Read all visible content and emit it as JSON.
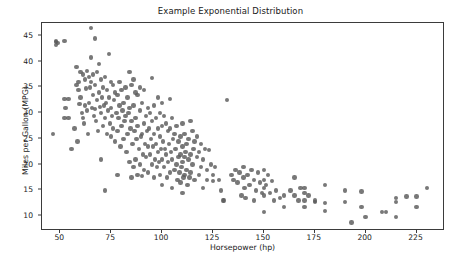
{
  "chart_data": {
    "type": "scatter",
    "title": "Example Exponential Distribution",
    "xlabel": "Horsepower (hp)",
    "ylabel": "Miles per Gallon (MPG)",
    "xlim": [
      41,
      238
    ],
    "ylim": [
      7.5,
      47.5
    ],
    "xticks": [
      50,
      75,
      100,
      125,
      150,
      175,
      200,
      225
    ],
    "xtick_labels": [
      "50",
      "75",
      "100",
      "125",
      "150",
      "175",
      "200",
      "225"
    ],
    "yticks": [
      10,
      15,
      20,
      25,
      30,
      35,
      40,
      45
    ],
    "ytick_labels": [
      "10",
      "15",
      "20",
      "25",
      "30",
      "35",
      "40",
      "45"
    ],
    "grid": false,
    "legend": null,
    "marker": {
      "shape": "circle",
      "color": "#5a5a5a",
      "opacity": 0.82,
      "size_px": 4.4
    },
    "series": [
      {
        "name": "vehicles",
        "points": [
          [
            46.5,
            26.0
          ],
          [
            48.0,
            43.8
          ],
          [
            48.0,
            43.2
          ],
          [
            48.0,
            44.0
          ],
          [
            49.0,
            43.6
          ],
          [
            52.0,
            44.0
          ],
          [
            52.0,
            32.8
          ],
          [
            52.0,
            29.0
          ],
          [
            52.5,
            31.0
          ],
          [
            54.0,
            29.0
          ],
          [
            54.0,
            32.8
          ],
          [
            55.5,
            23.0
          ],
          [
            57.0,
            27.0
          ],
          [
            58.0,
            39.0
          ],
          [
            58.0,
            35.5
          ],
          [
            58.5,
            24.5
          ],
          [
            59.0,
            36.0
          ],
          [
            59.0,
            34.5
          ],
          [
            59.5,
            31.8
          ],
          [
            60.0,
            38.0
          ],
          [
            60.0,
            33.0
          ],
          [
            60.5,
            30.0
          ],
          [
            61.0,
            37.5
          ],
          [
            61.0,
            29.0
          ],
          [
            61.5,
            28.0
          ],
          [
            62.0,
            36.5
          ],
          [
            62.0,
            31.5
          ],
          [
            62.5,
            34.8
          ],
          [
            63.0,
            38.2
          ],
          [
            63.0,
            30.5
          ],
          [
            63.5,
            26.0
          ],
          [
            64.0,
            37.0
          ],
          [
            64.0,
            32.0
          ],
          [
            64.5,
            35.0
          ],
          [
            65.0,
            46.5
          ],
          [
            65.0,
            40.8
          ],
          [
            65.0,
            36.0
          ],
          [
            65.5,
            31.0
          ],
          [
            66.0,
            37.5
          ],
          [
            66.0,
            33.5
          ],
          [
            66.5,
            29.5
          ],
          [
            67.0,
            44.5
          ],
          [
            67.0,
            35.5
          ],
          [
            67.0,
            30.8
          ],
          [
            67.5,
            28.5
          ],
          [
            68.0,
            38.0
          ],
          [
            68.0,
            32.5
          ],
          [
            68.5,
            26.5
          ],
          [
            69.0,
            39.5
          ],
          [
            69.0,
            34.0
          ],
          [
            69.5,
            31.2
          ],
          [
            70.0,
            36.5
          ],
          [
            70.0,
            30.0
          ],
          [
            70.0,
            21.0
          ],
          [
            70.5,
            33.0
          ],
          [
            71.0,
            35.0
          ],
          [
            71.0,
            27.5
          ],
          [
            71.5,
            31.5
          ],
          [
            72.0,
            37.0
          ],
          [
            72.0,
            29.0
          ],
          [
            72.0,
            15.0
          ],
          [
            72.5,
            32.0
          ],
          [
            73.0,
            34.5
          ],
          [
            73.0,
            26.0
          ],
          [
            73.5,
            30.5
          ],
          [
            74.0,
            41.5
          ],
          [
            74.0,
            33.0
          ],
          [
            74.5,
            28.0
          ],
          [
            75.0,
            36.0
          ],
          [
            75.0,
            31.0
          ],
          [
            75.0,
            25.5
          ],
          [
            75.5,
            29.5
          ],
          [
            76.0,
            35.5
          ],
          [
            76.0,
            27.0
          ],
          [
            76.5,
            32.5
          ],
          [
            77.0,
            34.0
          ],
          [
            77.0,
            24.5
          ],
          [
            77.5,
            30.0
          ],
          [
            78.0,
            33.5
          ],
          [
            78.0,
            26.5
          ],
          [
            78.0,
            18.0
          ],
          [
            78.5,
            29.0
          ],
          [
            79.0,
            36.0
          ],
          [
            79.0,
            31.5
          ],
          [
            79.5,
            23.5
          ],
          [
            80.0,
            34.5
          ],
          [
            80.0,
            27.5
          ],
          [
            80.5,
            30.5
          ],
          [
            81.0,
            32.0
          ],
          [
            81.0,
            25.0
          ],
          [
            81.5,
            28.5
          ],
          [
            82.0,
            35.0
          ],
          [
            82.0,
            29.5
          ],
          [
            82.5,
            22.5
          ],
          [
            83.0,
            33.0
          ],
          [
            83.0,
            26.0
          ],
          [
            83.5,
            30.0
          ],
          [
            84.0,
            38.0
          ],
          [
            84.0,
            31.0
          ],
          [
            84.0,
            20.5
          ],
          [
            84.5,
            27.0
          ],
          [
            85.0,
            35.5
          ],
          [
            85.0,
            28.5
          ],
          [
            85.0,
            17.5
          ],
          [
            85.5,
            24.0
          ],
          [
            86.0,
            36.5
          ],
          [
            86.0,
            31.5
          ],
          [
            86.0,
            19.5
          ],
          [
            86.5,
            26.5
          ],
          [
            87.0,
            34.0
          ],
          [
            87.0,
            29.0
          ],
          [
            87.0,
            21.0
          ],
          [
            87.5,
            25.0
          ],
          [
            88.0,
            33.5
          ],
          [
            88.0,
            27.5
          ],
          [
            88.0,
            18.0
          ],
          [
            88.5,
            23.0
          ],
          [
            89.0,
            35.0
          ],
          [
            89.0,
            30.5
          ],
          [
            89.0,
            20.0
          ],
          [
            89.5,
            25.5
          ],
          [
            90.0,
            32.0
          ],
          [
            90.0,
            26.0
          ],
          [
            90.0,
            17.8
          ],
          [
            90.5,
            22.0
          ],
          [
            91.0,
            34.5
          ],
          [
            91.0,
            28.0
          ],
          [
            91.0,
            19.0
          ],
          [
            91.5,
            24.0
          ],
          [
            92.0,
            29.5
          ],
          [
            92.0,
            21.5
          ],
          [
            92.5,
            26.5
          ],
          [
            93.0,
            31.0
          ],
          [
            93.0,
            23.5
          ],
          [
            93.0,
            18.5
          ],
          [
            93.5,
            27.0
          ],
          [
            94.0,
            30.0
          ],
          [
            94.0,
            22.0
          ],
          [
            94.5,
            25.0
          ],
          [
            95.0,
            36.8
          ],
          [
            95.0,
            28.5
          ],
          [
            95.0,
            20.0
          ],
          [
            95.5,
            23.5
          ],
          [
            96.0,
            31.5
          ],
          [
            96.0,
            26.0
          ],
          [
            96.0,
            17.5
          ],
          [
            96.5,
            21.0
          ],
          [
            97.0,
            29.0
          ],
          [
            97.0,
            24.0
          ],
          [
            97.5,
            19.5
          ],
          [
            98.0,
            33.0
          ],
          [
            98.0,
            27.0
          ],
          [
            98.0,
            22.5
          ],
          [
            98.5,
            20.5
          ],
          [
            99.0,
            30.0
          ],
          [
            99.0,
            25.5
          ],
          [
            99.0,
            18.0
          ],
          [
            99.5,
            23.0
          ],
          [
            100.0,
            32.0
          ],
          [
            100.0,
            27.5
          ],
          [
            100.0,
            21.0
          ],
          [
            100.0,
            16.0
          ],
          [
            100.5,
            24.5
          ],
          [
            101.0,
            29.5
          ],
          [
            101.0,
            19.5
          ],
          [
            101.5,
            23.0
          ],
          [
            102.0,
            28.0
          ],
          [
            102.0,
            22.0
          ],
          [
            102.5,
            17.5
          ],
          [
            103.0,
            26.5
          ],
          [
            103.0,
            20.5
          ],
          [
            103.5,
            24.0
          ],
          [
            104.0,
            32.8
          ],
          [
            104.0,
            27.0
          ],
          [
            104.0,
            18.5
          ],
          [
            104.5,
            22.5
          ],
          [
            105.0,
            29.0
          ],
          [
            105.0,
            21.0
          ],
          [
            105.0,
            15.5
          ],
          [
            105.5,
            25.0
          ],
          [
            106.0,
            26.0
          ],
          [
            106.0,
            19.0
          ],
          [
            106.5,
            23.0
          ],
          [
            107.0,
            27.5
          ],
          [
            107.0,
            20.0
          ],
          [
            107.5,
            17.0
          ],
          [
            108.0,
            24.5
          ],
          [
            108.0,
            21.5
          ],
          [
            108.5,
            18.5
          ],
          [
            109.0,
            25.5
          ],
          [
            109.0,
            22.0
          ],
          [
            109.0,
            16.5
          ],
          [
            109.5,
            19.5
          ],
          [
            110.0,
            28.0
          ],
          [
            110.0,
            23.5
          ],
          [
            110.0,
            20.5
          ],
          [
            110.0,
            14.5
          ],
          [
            110.5,
            17.5
          ],
          [
            111.0,
            26.0
          ],
          [
            111.0,
            21.5
          ],
          [
            111.0,
            18.0
          ],
          [
            111.5,
            22.5
          ],
          [
            112.0,
            24.0
          ],
          [
            112.0,
            19.0
          ],
          [
            112.5,
            16.0
          ],
          [
            113.0,
            25.0
          ],
          [
            113.0,
            21.0
          ],
          [
            113.5,
            17.5
          ],
          [
            114.0,
            28.5
          ],
          [
            114.0,
            22.0
          ],
          [
            114.0,
            18.5
          ],
          [
            115.0,
            26.5
          ],
          [
            115.0,
            20.0
          ],
          [
            115.5,
            23.0
          ],
          [
            116.0,
            24.5
          ],
          [
            116.0,
            17.0
          ],
          [
            117.0,
            25.5
          ],
          [
            117.0,
            21.5
          ],
          [
            118.0,
            22.5
          ],
          [
            118.0,
            18.0
          ],
          [
            119.0,
            24.0
          ],
          [
            119.0,
            19.5
          ],
          [
            120.0,
            21.0
          ],
          [
            120.0,
            15.5
          ],
          [
            121.0,
            23.0
          ],
          [
            122.0,
            19.0
          ],
          [
            122.0,
            17.0
          ],
          [
            123.0,
            22.8
          ],
          [
            124.0,
            20.0
          ],
          [
            125.0,
            18.0
          ],
          [
            125.0,
            16.8
          ],
          [
            126.0,
            19.5
          ],
          [
            128.0,
            17.0
          ],
          [
            129.0,
            15.0
          ],
          [
            130.0,
            13.0
          ],
          [
            130.5,
            13.0
          ],
          [
            132.0,
            32.5
          ],
          [
            134.0,
            18.0
          ],
          [
            135.0,
            17.0
          ],
          [
            136.0,
            19.0
          ],
          [
            137.0,
            16.5
          ],
          [
            138.0,
            18.5
          ],
          [
            139.0,
            14.0
          ],
          [
            140.0,
            19.5
          ],
          [
            140.0,
            17.5
          ],
          [
            140.5,
            15.5
          ],
          [
            141.0,
            13.5
          ],
          [
            142.0,
            18.0
          ],
          [
            143.0,
            16.0
          ],
          [
            144.0,
            19.0
          ],
          [
            145.0,
            17.0
          ],
          [
            145.0,
            13.0
          ],
          [
            146.0,
            15.0
          ],
          [
            147.0,
            18.5
          ],
          [
            148.0,
            16.5
          ],
          [
            149.0,
            14.5
          ],
          [
            150.0,
            19.0
          ],
          [
            150.0,
            17.0
          ],
          [
            150.0,
            15.5
          ],
          [
            150.0,
            14.0
          ],
          [
            150.0,
            10.8
          ],
          [
            151.0,
            16.0
          ],
          [
            152.0,
            18.0
          ],
          [
            153.0,
            14.5
          ],
          [
            154.0,
            16.8
          ],
          [
            155.0,
            13.0
          ],
          [
            156.0,
            15.0
          ],
          [
            158.0,
            13.5
          ],
          [
            160.0,
            14.0
          ],
          [
            160.0,
            11.8
          ],
          [
            163.0,
            15.0
          ],
          [
            165.0,
            17.5
          ],
          [
            165.0,
            14.0
          ],
          [
            167.0,
            13.0
          ],
          [
            168.0,
            15.5
          ],
          [
            170.0,
            15.5
          ],
          [
            170.0,
            14.5
          ],
          [
            170.0,
            13.0
          ],
          [
            170.0,
            11.8
          ],
          [
            172.0,
            14.0
          ],
          [
            175.0,
            13.0
          ],
          [
            175.0,
            12.8
          ],
          [
            180.0,
            16.0
          ],
          [
            180.0,
            12.5
          ],
          [
            180.0,
            11.0
          ],
          [
            190.0,
            15.0
          ],
          [
            190.0,
            12.8
          ],
          [
            193.0,
            8.8
          ],
          [
            198.0,
            14.8
          ],
          [
            198.0,
            11.8
          ],
          [
            200.0,
            9.8
          ],
          [
            208.0,
            10.8
          ],
          [
            210.0,
            10.8
          ],
          [
            215.0,
            13.5
          ],
          [
            215.0,
            12.8
          ],
          [
            215.0,
            9.8
          ],
          [
            220.0,
            13.8
          ],
          [
            225.0,
            13.8
          ],
          [
            225.0,
            11.8
          ],
          [
            230.0,
            15.5
          ]
        ]
      }
    ]
  }
}
